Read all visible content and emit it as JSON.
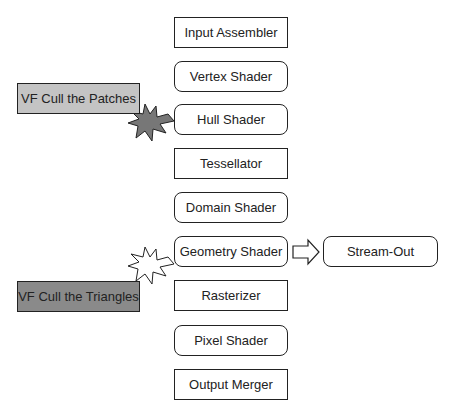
{
  "pipeline": {
    "stages": [
      {
        "label": "Input Assembler",
        "shape": "rect",
        "top": 17
      },
      {
        "label": "Vertex Shader",
        "shape": "round",
        "top": 61
      },
      {
        "label": "Hull Shader",
        "shape": "round",
        "top": 104
      },
      {
        "label": "Tessellator",
        "shape": "rect",
        "top": 148
      },
      {
        "label": "Domain Shader",
        "shape": "round",
        "top": 192
      },
      {
        "label": "Geometry Shader",
        "shape": "round",
        "top": 236
      },
      {
        "label": "Rasterizer",
        "shape": "rect",
        "top": 280
      },
      {
        "label": "Pixel Shader",
        "shape": "round",
        "top": 325
      },
      {
        "label": "Output Merger",
        "shape": "rect",
        "top": 369
      }
    ],
    "stream_out": {
      "label": "Stream-Out"
    }
  },
  "annotations": {
    "patches": {
      "label": "VF Cull the Patches",
      "color": "#c4c4c4"
    },
    "triangles": {
      "label": "VF Cull the Triangles",
      "color": "#8a8a8a"
    }
  },
  "colors": {
    "stroke": "#222222",
    "starDark": "#777777"
  }
}
